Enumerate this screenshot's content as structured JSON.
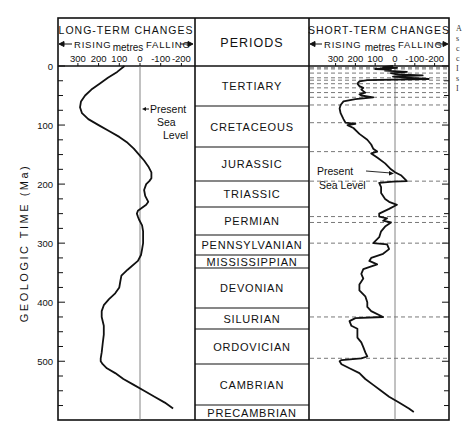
{
  "chart_data": {
    "type": "line",
    "ylabel": "GEOLOGIC TIME (Ma)",
    "y_ticks": [
      0,
      100,
      200,
      300,
      400,
      500
    ],
    "ylim": [
      0,
      590
    ],
    "y_inverted": true,
    "grid": false,
    "panels": [
      {
        "name": "long_term",
        "title": "LONG-TERM CHANGES",
        "rising_label": "RISING",
        "falling_label": "FALLING",
        "unit_label": "metres",
        "xlabel": "metres",
        "x_ticks": [
          300,
          200,
          100,
          0,
          -100,
          -200
        ],
        "x_tick_labels": [
          "300",
          "200",
          "100",
          "0",
          "-100",
          "-200"
        ],
        "xlim": [
          375,
          -255
        ],
        "reference_line": {
          "value": 0,
          "label": "Present Sea Level"
        },
        "series": [
          {
            "name": "Long-term sea level",
            "points": [
              [
                0,
                75
              ],
              [
                10,
                110
              ],
              [
                20,
                155
              ],
              [
                30,
                195
              ],
              [
                40,
                235
              ],
              [
                50,
                265
              ],
              [
                60,
                285
              ],
              [
                70,
                290
              ],
              [
                80,
                280
              ],
              [
                90,
                250
              ],
              [
                100,
                200
              ],
              [
                110,
                150
              ],
              [
                120,
                100
              ],
              [
                130,
                60
              ],
              [
                140,
                30
              ],
              [
                150,
                5
              ],
              [
                160,
                -20
              ],
              [
                170,
                -40
              ],
              [
                180,
                -55
              ],
              [
                190,
                -55
              ],
              [
                195,
                -45
              ],
              [
                200,
                -30
              ],
              [
                210,
                -20
              ],
              [
                220,
                -25
              ],
              [
                230,
                -40
              ],
              [
                235,
                -30
              ],
              [
                245,
                10
              ],
              [
                250,
                15
              ],
              [
                255,
                10
              ],
              [
                260,
                5
              ],
              [
                270,
                -10
              ],
              [
                280,
                -15
              ],
              [
                290,
                -15
              ],
              [
                300,
                -15
              ],
              [
                310,
                -10
              ],
              [
                320,
                -5
              ],
              [
                330,
                10
              ],
              [
                345,
                60
              ],
              [
                355,
                90
              ],
              [
                365,
                95
              ],
              [
                375,
                100
              ],
              [
                385,
                120
              ],
              [
                395,
                150
              ],
              [
                405,
                175
              ],
              [
                415,
                185
              ],
              [
                425,
                185
              ],
              [
                440,
                175
              ],
              [
                455,
                175
              ],
              [
                470,
                180
              ],
              [
                485,
                185
              ],
              [
                495,
                190
              ],
              [
                500,
                190
              ],
              [
                505,
                180
              ],
              [
                512,
                160
              ],
              [
                520,
                120
              ],
              [
                530,
                80
              ],
              [
                540,
                30
              ],
              [
                550,
                -20
              ],
              [
                560,
                -70
              ],
              [
                570,
                -120
              ],
              [
                580,
                -160
              ]
            ]
          }
        ]
      },
      {
        "name": "short_term",
        "title": "SHORT-TERM CHANGES",
        "rising_label": "RISING",
        "falling_label": "FALLING",
        "unit_label": "metres",
        "xlabel": "metres",
        "x_ticks": [
          300,
          200,
          100,
          0,
          -100,
          -200
        ],
        "x_tick_labels": [
          "300",
          "200",
          "100",
          "0",
          "-100",
          "-200"
        ],
        "xlim": [
          375,
          -265
        ],
        "reference_line": {
          "value": 0,
          "label": "Present Sea Level"
        },
        "dashed_boundaries_ma": [
          3,
          5,
          12,
          20,
          24,
          30,
          37,
          45,
          53,
          66,
          96,
          145,
          195,
          255,
          265,
          300,
          425,
          495
        ],
        "series": [
          {
            "name": "Short-term sea level",
            "points": [
              [
                0,
                10
              ],
              [
                2,
                60
              ],
              [
                3,
                -10
              ],
              [
                5,
                100
              ],
              [
                6,
                20
              ],
              [
                8,
                50
              ],
              [
                10,
                -60
              ],
              [
                12,
                20
              ],
              [
                14,
                -10
              ],
              [
                16,
                -140
              ],
              [
                18,
                10
              ],
              [
                20,
                -80
              ],
              [
                22,
                -170
              ],
              [
                24,
                140
              ],
              [
                26,
                180
              ],
              [
                30,
                190
              ],
              [
                34,
                180
              ],
              [
                37,
                160
              ],
              [
                40,
                170
              ],
              [
                45,
                150
              ],
              [
                48,
                180
              ],
              [
                50,
                170
              ],
              [
                53,
                110
              ],
              [
                56,
                200
              ],
              [
                60,
                260
              ],
              [
                66,
                275
              ],
              [
                72,
                280
              ],
              [
                80,
                275
              ],
              [
                90,
                260
              ],
              [
                96,
                250
              ],
              [
                98,
                200
              ],
              [
                100,
                240
              ],
              [
                105,
                210
              ],
              [
                115,
                180
              ],
              [
                125,
                140
              ],
              [
                133,
                120
              ],
              [
                140,
                110
              ],
              [
                145,
                90
              ],
              [
                148,
                120
              ],
              [
                155,
                90
              ],
              [
                165,
                50
              ],
              [
                175,
                20
              ],
              [
                180,
                0
              ],
              [
                185,
                -30
              ],
              [
                195,
                -60
              ],
              [
                196,
                10
              ],
              [
                198,
                80
              ],
              [
                205,
                70
              ],
              [
                215,
                70
              ],
              [
                225,
                50
              ],
              [
                230,
                30
              ],
              [
                235,
                -10
              ],
              [
                242,
                30
              ],
              [
                250,
                80
              ],
              [
                255,
                80
              ],
              [
                258,
                40
              ],
              [
                262,
                60
              ],
              [
                265,
                20
              ],
              [
                272,
                50
              ],
              [
                280,
                70
              ],
              [
                290,
                80
              ],
              [
                300,
                110
              ],
              [
                302,
                40
              ],
              [
                310,
                30
              ],
              [
                318,
                60
              ],
              [
                325,
                120
              ],
              [
                330,
                130
              ],
              [
                336,
                90
              ],
              [
                344,
                160
              ],
              [
                352,
                170
              ],
              [
                360,
                160
              ],
              [
                370,
                180
              ],
              [
                380,
                180
              ],
              [
                390,
                150
              ],
              [
                400,
                140
              ],
              [
                408,
                140
              ],
              [
                415,
                120
              ],
              [
                425,
                60
              ],
              [
                427,
                200
              ],
              [
                432,
                230
              ],
              [
                440,
                220
              ],
              [
                445,
                190
              ],
              [
                452,
                190
              ],
              [
                460,
                190
              ],
              [
                468,
                170
              ],
              [
                476,
                160
              ],
              [
                485,
                150
              ],
              [
                492,
                140
              ],
              [
                495,
                170
              ],
              [
                498,
                270
              ],
              [
                500,
                280
              ],
              [
                505,
                270
              ],
              [
                512,
                230
              ],
              [
                520,
                180
              ],
              [
                530,
                150
              ],
              [
                540,
                110
              ],
              [
                550,
                70
              ],
              [
                560,
                30
              ],
              [
                570,
                -20
              ],
              [
                580,
                -70
              ],
              [
                586,
                -95
              ]
            ]
          }
        ]
      }
    ],
    "periods": [
      {
        "name": "TERTIARY",
        "start_ma": 0,
        "end_ma": 66
      },
      {
        "name": "CRETACEOUS",
        "start_ma": 66,
        "end_ma": 136
      },
      {
        "name": "JURASSIC",
        "start_ma": 136,
        "end_ma": 195
      },
      {
        "name": "TRIASSIC",
        "start_ma": 195,
        "end_ma": 240
      },
      {
        "name": "PERMIAN",
        "start_ma": 240,
        "end_ma": 287
      },
      {
        "name": "PENNSYLVANIAN",
        "start_ma": 287,
        "end_ma": 320
      },
      {
        "name": "MISSISSIPPIAN",
        "start_ma": 320,
        "end_ma": 343
      },
      {
        "name": "DEVONIAN",
        "start_ma": 343,
        "end_ma": 411
      },
      {
        "name": "SILURIAN",
        "start_ma": 411,
        "end_ma": 447
      },
      {
        "name": "ORDOVICIAN",
        "start_ma": 447,
        "end_ma": 506
      },
      {
        "name": "CAMBRIAN",
        "start_ma": 506,
        "end_ma": 576
      },
      {
        "name": "PRECAMBRIAN",
        "start_ma": 576,
        "end_ma": 602
      }
    ]
  },
  "labels": {
    "long_title": "LONG-TERM CHANGES",
    "short_title": "SHORT-TERM CHANGES",
    "periods_header": "PERIODS",
    "rising": "RISING",
    "falling": "FALLING",
    "metres": "metres",
    "y_axis": "GEOLOGIC TIME (Ma)",
    "present_sea_level_long": [
      "Present",
      "Sea",
      "Level"
    ],
    "present_sea_level_short": [
      "Present",
      "Sea Level"
    ]
  },
  "edge_fragment": [
    "A",
    "s",
    "c",
    "c",
    "I",
    "s",
    "I"
  ],
  "colors": {
    "ink": "#111111",
    "reference_line": "#777777",
    "dashed": "#555555",
    "background": "#ffffff"
  }
}
